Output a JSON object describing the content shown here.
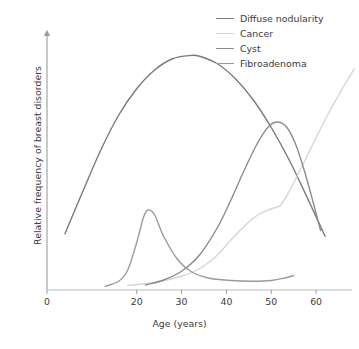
{
  "chart_data": {
    "type": "line",
    "title": "",
    "xlabel": "Age (years)",
    "ylabel": "Relative frequency of breast disorders",
    "xlim": [
      0,
      68
    ],
    "ylim": [
      0,
      1
    ],
    "xticks": [
      0,
      20,
      30,
      40,
      50,
      60
    ],
    "xtick_labels": [
      "0",
      "20",
      "30",
      "40",
      "50",
      "60"
    ],
    "yticks": [],
    "ytick_labels": [],
    "grid": false,
    "legend_position": "top-right",
    "axes_style": "two-spine-arrow",
    "series": [
      {
        "name": "Diffuse nodularity",
        "color": "#7a7a7a",
        "points": [
          [
            4.0,
            0.225
          ],
          [
            8.0,
            0.395
          ],
          [
            12.0,
            0.56
          ],
          [
            16.0,
            0.7
          ],
          [
            20.0,
            0.805
          ],
          [
            24.0,
            0.88
          ],
          [
            28.0,
            0.925
          ],
          [
            32.0,
            0.938
          ],
          [
            34.0,
            0.935
          ],
          [
            38.0,
            0.905
          ],
          [
            42.0,
            0.845
          ],
          [
            46.0,
            0.76
          ],
          [
            50.0,
            0.65
          ],
          [
            54.0,
            0.52
          ],
          [
            58.0,
            0.37
          ],
          [
            62.0,
            0.215
          ]
        ]
      },
      {
        "name": "Cancer",
        "color": "#d6d6d6",
        "points": [
          [
            18.0,
            0.018
          ],
          [
            24.0,
            0.03
          ],
          [
            30.0,
            0.055
          ],
          [
            34.0,
            0.085
          ],
          [
            38.0,
            0.14
          ],
          [
            41.0,
            0.2
          ],
          [
            44.0,
            0.255
          ],
          [
            47.0,
            0.3
          ],
          [
            50.0,
            0.325
          ],
          [
            52.0,
            0.338
          ],
          [
            54.0,
            0.395
          ],
          [
            57.0,
            0.5
          ],
          [
            60.0,
            0.61
          ],
          [
            63.0,
            0.715
          ],
          [
            66.0,
            0.81
          ],
          [
            68.5,
            0.885
          ]
        ]
      },
      {
        "name": "Cyst",
        "color": "#8c8c8c",
        "points": [
          [
            22.0,
            0.02
          ],
          [
            26.0,
            0.04
          ],
          [
            30.0,
            0.075
          ],
          [
            34.0,
            0.14
          ],
          [
            38.0,
            0.25
          ],
          [
            41.0,
            0.36
          ],
          [
            44.0,
            0.48
          ],
          [
            47.0,
            0.59
          ],
          [
            49.5,
            0.655
          ],
          [
            51.5,
            0.672
          ],
          [
            53.5,
            0.65
          ],
          [
            55.5,
            0.58
          ],
          [
            57.5,
            0.47
          ],
          [
            59.5,
            0.34
          ],
          [
            61.0,
            0.238
          ]
        ]
      },
      {
        "name": "Fibroadenoma",
        "color": "#9a9a9a",
        "points": [
          [
            13.0,
            0.015
          ],
          [
            16.0,
            0.035
          ],
          [
            18.0,
            0.08
          ],
          [
            20.0,
            0.19
          ],
          [
            21.5,
            0.29
          ],
          [
            22.5,
            0.32
          ],
          [
            24.0,
            0.3
          ],
          [
            26.0,
            0.215
          ],
          [
            29.0,
            0.125
          ],
          [
            32.0,
            0.075
          ],
          [
            36.0,
            0.048
          ],
          [
            41.0,
            0.038
          ],
          [
            46.0,
            0.035
          ],
          [
            50.0,
            0.038
          ],
          [
            53.0,
            0.048
          ],
          [
            55.0,
            0.058
          ]
        ]
      }
    ]
  },
  "legend": {
    "items": [
      {
        "label": "Diffuse nodularity",
        "color": "#7a7a7a"
      },
      {
        "label": "Cancer",
        "color": "#d6d6d6"
      },
      {
        "label": "Cyst",
        "color": "#8c8c8c"
      },
      {
        "label": "Fibroadenoma",
        "color": "#9a9a9a"
      }
    ]
  },
  "axes": {
    "x_title": "Age (years)",
    "y_title": "Relative frequency of breast disorders",
    "x_tick_labels": [
      "0",
      "20",
      "30",
      "40",
      "50",
      "60"
    ],
    "axis_color": "#9c9c9c"
  }
}
